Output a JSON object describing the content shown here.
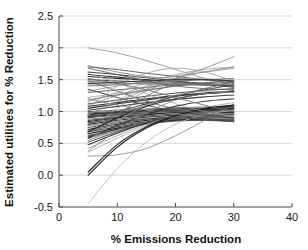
{
  "chart_data": {
    "type": "line",
    "title": "",
    "xlabel": "% Emissions Reduction",
    "ylabel": "Estimated utilities for % Reduction",
    "xlim": [
      0,
      40
    ],
    "ylim": [
      -0.5,
      2.5
    ],
    "xticks": [
      0,
      10,
      20,
      30,
      40
    ],
    "xtick_labels": [
      "0",
      "10",
      "20",
      "30",
      "40"
    ],
    "yticks": [
      -0.5,
      0.0,
      0.5,
      1.0,
      1.5,
      2.0,
      2.5
    ],
    "ytick_labels": [
      "-0.5",
      "0.0",
      "0.5",
      "1.0",
      "1.5",
      "2.0",
      "2.5"
    ],
    "grid": "horizontal",
    "grid_color": "#c8c8c8",
    "legend": "none",
    "x_data_range": [
      5,
      30
    ],
    "x": [
      5,
      10,
      15,
      20,
      25,
      30
    ],
    "series": [
      {
        "name": "r01",
        "values": [
          2.0,
          1.92,
          1.8,
          1.66,
          1.52,
          1.4
        ],
        "color": "#8c8c8c",
        "width": 0.8
      },
      {
        "name": "r02",
        "values": [
          1.72,
          1.62,
          1.55,
          1.52,
          1.5,
          1.48
        ],
        "color": "#777777",
        "width": 0.8
      },
      {
        "name": "r03",
        "values": [
          1.7,
          1.66,
          1.6,
          1.55,
          1.5,
          1.46
        ],
        "color": "#555555",
        "width": 0.9
      },
      {
        "name": "r04",
        "values": [
          1.62,
          1.58,
          1.53,
          1.48,
          1.43,
          1.38
        ],
        "color": "#444444",
        "width": 1.0
      },
      {
        "name": "r05",
        "values": [
          1.58,
          1.54,
          1.5,
          1.47,
          1.44,
          1.4
        ],
        "color": "#3a3a3a",
        "width": 1.1
      },
      {
        "name": "r06",
        "values": [
          1.55,
          1.52,
          1.49,
          1.46,
          1.43,
          1.4
        ],
        "color": "#303030",
        "width": 1.1
      },
      {
        "name": "r07",
        "values": [
          1.5,
          1.48,
          1.46,
          1.44,
          1.42,
          1.4
        ],
        "color": "#4a4a4a",
        "width": 1.0
      },
      {
        "name": "r08",
        "values": [
          1.48,
          1.45,
          1.43,
          1.42,
          1.41,
          1.4
        ],
        "color": "#666666",
        "width": 0.8
      },
      {
        "name": "r09",
        "values": [
          1.45,
          1.44,
          1.44,
          1.44,
          1.43,
          1.42
        ],
        "color": "#8a8a8a",
        "width": 0.8
      },
      {
        "name": "r10",
        "values": [
          1.42,
          1.43,
          1.44,
          1.45,
          1.44,
          1.42
        ],
        "color": "#9a9a9a",
        "width": 0.8
      },
      {
        "name": "r11",
        "values": [
          1.4,
          1.42,
          1.45,
          1.48,
          1.5,
          1.52
        ],
        "color": "#707070",
        "width": 0.9
      },
      {
        "name": "r12",
        "values": [
          1.32,
          1.4,
          1.48,
          1.56,
          1.62,
          1.68
        ],
        "color": "#8f8f8f",
        "width": 0.8
      },
      {
        "name": "r13",
        "values": [
          1.3,
          1.34,
          1.38,
          1.42,
          1.44,
          1.46
        ],
        "color": "#5a5a5a",
        "width": 0.9
      },
      {
        "name": "r14",
        "values": [
          1.22,
          1.28,
          1.34,
          1.4,
          1.45,
          1.5
        ],
        "color": "#a0a0a0",
        "width": 0.8
      },
      {
        "name": "r15",
        "values": [
          1.18,
          1.26,
          1.33,
          1.4,
          1.45,
          1.48
        ],
        "color": "#606060",
        "width": 0.9
      },
      {
        "name": "r16",
        "values": [
          1.15,
          1.3,
          1.45,
          1.58,
          1.66,
          1.7
        ],
        "color": "#9c9c9c",
        "width": 0.8
      },
      {
        "name": "r17",
        "values": [
          1.12,
          1.18,
          1.24,
          1.29,
          1.33,
          1.36
        ],
        "color": "#4f4f4f",
        "width": 1.0
      },
      {
        "name": "r18",
        "values": [
          1.08,
          1.14,
          1.2,
          1.25,
          1.29,
          1.32
        ],
        "color": "#3c3c3c",
        "width": 1.1
      },
      {
        "name": "r19",
        "values": [
          1.05,
          1.12,
          1.18,
          1.24,
          1.28,
          1.31
        ],
        "color": "#2e2e2e",
        "width": 1.2
      },
      {
        "name": "r20",
        "values": [
          1.02,
          1.08,
          1.14,
          1.19,
          1.23,
          1.26
        ],
        "color": "#424242",
        "width": 1.1
      },
      {
        "name": "r21",
        "values": [
          1.0,
          1.02,
          1.04,
          1.06,
          1.07,
          1.08
        ],
        "color": "#6b6b6b",
        "width": 0.9
      },
      {
        "name": "r22",
        "values": [
          0.98,
          1.0,
          1.02,
          1.04,
          1.05,
          1.06
        ],
        "color": "#555555",
        "width": 1.0
      },
      {
        "name": "r23",
        "values": [
          0.96,
          0.99,
          1.02,
          1.04,
          1.05,
          1.05
        ],
        "color": "#3a3a3a",
        "width": 1.1
      },
      {
        "name": "r24",
        "values": [
          0.95,
          0.98,
          1.0,
          1.02,
          1.03,
          1.04
        ],
        "color": "#2a2a2a",
        "width": 1.2
      },
      {
        "name": "r25",
        "values": [
          0.93,
          0.97,
          1.0,
          1.02,
          1.03,
          1.03
        ],
        "color": "#484848",
        "width": 1.0
      },
      {
        "name": "r26",
        "values": [
          0.92,
          0.95,
          0.98,
          1.0,
          1.01,
          1.02
        ],
        "color": "#333333",
        "width": 1.1
      },
      {
        "name": "r27",
        "values": [
          0.9,
          0.94,
          0.97,
          0.99,
          1.0,
          1.0
        ],
        "color": "#5e5e5e",
        "width": 0.9
      },
      {
        "name": "r28",
        "values": [
          0.88,
          0.92,
          0.96,
          0.99,
          1.0,
          1.0
        ],
        "color": "#7a7a7a",
        "width": 0.8
      },
      {
        "name": "r29",
        "values": [
          0.86,
          0.91,
          0.95,
          0.98,
          0.99,
          0.99
        ],
        "color": "#414141",
        "width": 1.1
      },
      {
        "name": "r30",
        "values": [
          0.84,
          0.9,
          0.95,
          0.98,
          0.99,
          0.98
        ],
        "color": "#2d2d2d",
        "width": 1.2
      },
      {
        "name": "r31",
        "values": [
          0.82,
          0.88,
          0.93,
          0.96,
          0.97,
          0.96
        ],
        "color": "#505050",
        "width": 1.0
      },
      {
        "name": "r32",
        "values": [
          0.8,
          0.86,
          0.91,
          0.94,
          0.95,
          0.95
        ],
        "color": "#383838",
        "width": 1.1
      },
      {
        "name": "r33",
        "values": [
          0.78,
          0.84,
          0.89,
          0.92,
          0.93,
          0.92
        ],
        "color": "#646464",
        "width": 0.9
      },
      {
        "name": "r34",
        "values": [
          0.75,
          0.82,
          0.88,
          0.91,
          0.92,
          0.9
        ],
        "color": "#444444",
        "width": 1.0
      },
      {
        "name": "r35",
        "values": [
          0.72,
          0.8,
          0.86,
          0.9,
          0.91,
          0.89
        ],
        "color": "#2c2c2c",
        "width": 1.2
      },
      {
        "name": "r36",
        "values": [
          0.7,
          0.78,
          0.84,
          0.88,
          0.89,
          0.87
        ],
        "color": "#585858",
        "width": 1.0
      },
      {
        "name": "r37",
        "values": [
          0.68,
          0.76,
          0.83,
          0.87,
          0.88,
          0.86
        ],
        "color": "#3e3e3e",
        "width": 1.1
      },
      {
        "name": "r38",
        "values": [
          0.65,
          0.74,
          0.81,
          0.86,
          0.87,
          0.85
        ],
        "color": "#262626",
        "width": 1.2
      },
      {
        "name": "r39",
        "values": [
          0.62,
          0.72,
          0.8,
          0.85,
          0.86,
          0.84
        ],
        "color": "#4c4c4c",
        "width": 1.0
      },
      {
        "name": "r40",
        "values": [
          0.6,
          0.72,
          0.82,
          0.89,
          0.93,
          0.95
        ],
        "color": "#353535",
        "width": 1.1
      },
      {
        "name": "r41",
        "values": [
          0.58,
          0.7,
          0.81,
          0.89,
          0.94,
          0.96
        ],
        "color": "#6e6e6e",
        "width": 0.9
      },
      {
        "name": "r42",
        "values": [
          0.55,
          0.7,
          0.83,
          0.93,
          0.99,
          1.02
        ],
        "color": "#8b8b8b",
        "width": 0.8
      },
      {
        "name": "r43",
        "values": [
          0.52,
          0.68,
          0.82,
          0.93,
          1.0,
          1.04
        ],
        "color": "#474747",
        "width": 1.0
      },
      {
        "name": "r44",
        "values": [
          0.48,
          0.66,
          0.82,
          0.94,
          1.02,
          1.06
        ],
        "color": "#323232",
        "width": 1.1
      },
      {
        "name": "r45",
        "values": [
          0.42,
          0.62,
          0.8,
          0.94,
          1.04,
          1.1
        ],
        "color": "#979797",
        "width": 0.8
      },
      {
        "name": "r46",
        "values": [
          0.36,
          0.58,
          0.78,
          0.94,
          1.06,
          1.14
        ],
        "color": "#a5a5a5",
        "width": 0.8
      },
      {
        "name": "r47",
        "values": [
          0.3,
          0.32,
          0.42,
          0.62,
          0.86,
          1.12
        ],
        "color": "#888888",
        "width": 0.8
      },
      {
        "name": "r48",
        "values": [
          0.05,
          0.48,
          0.76,
          0.94,
          1.05,
          1.1
        ],
        "color": "#2a2a2a",
        "width": 1.2
      },
      {
        "name": "r49",
        "values": [
          0.0,
          0.44,
          0.74,
          0.93,
          1.04,
          1.09
        ],
        "color": "#1f1f1f",
        "width": 1.2
      },
      {
        "name": "r50",
        "values": [
          -0.45,
          0.1,
          0.52,
          0.8,
          0.95,
          1.02
        ],
        "color": "#b4b4b4",
        "width": 0.8
      },
      {
        "name": "r51",
        "values": [
          1.6,
          1.45,
          1.28,
          1.12,
          1.0,
          0.92
        ],
        "color": "#9e9e9e",
        "width": 0.8
      },
      {
        "name": "r52",
        "values": [
          1.48,
          1.32,
          1.16,
          1.04,
          0.96,
          0.9
        ],
        "color": "#6a6a6a",
        "width": 0.9
      },
      {
        "name": "r53",
        "values": [
          1.35,
          1.22,
          1.1,
          1.0,
          0.94,
          0.9
        ],
        "color": "#4d4d4d",
        "width": 1.0
      },
      {
        "name": "r54",
        "values": [
          1.2,
          1.1,
          1.02,
          0.96,
          0.92,
          0.88
        ],
        "color": "#828282",
        "width": 0.8
      },
      {
        "name": "r55",
        "values": [
          1.0,
          0.96,
          0.93,
          0.9,
          0.88,
          0.86
        ],
        "color": "#595959",
        "width": 0.9
      },
      {
        "name": "r56",
        "values": [
          0.95,
          1.18,
          1.38,
          1.5,
          1.52,
          1.44
        ],
        "color": "#a8a8a8",
        "width": 0.8
      },
      {
        "name": "r57",
        "values": [
          0.7,
          1.05,
          1.32,
          1.48,
          1.5,
          1.4
        ],
        "color": "#909090",
        "width": 0.8
      },
      {
        "name": "r58",
        "values": [
          0.62,
          0.95,
          1.24,
          1.44,
          1.5,
          1.44
        ],
        "color": "#757575",
        "width": 0.9
      },
      {
        "name": "r59",
        "values": [
          0.58,
          0.78,
          0.95,
          1.08,
          1.16,
          1.2
        ],
        "color": "#3b3b3b",
        "width": 1.1
      },
      {
        "name": "r60",
        "values": [
          0.68,
          0.9,
          1.08,
          1.2,
          1.28,
          1.32
        ],
        "color": "#2f2f2f",
        "width": 1.2
      },
      {
        "name": "r61",
        "values": [
          1.52,
          1.44,
          1.34,
          1.22,
          1.1,
          1.0
        ],
        "color": "#737373",
        "width": 0.9
      },
      {
        "name": "r62",
        "values": [
          1.05,
          1.4,
          1.6,
          1.68,
          1.62,
          1.48
        ],
        "color": "#9b9b9b",
        "width": 0.8
      },
      {
        "name": "r63",
        "values": [
          0.9,
          1.0,
          1.12,
          1.24,
          1.34,
          1.42
        ],
        "color": "#464646",
        "width": 1.0
      },
      {
        "name": "r64",
        "values": [
          0.8,
          0.95,
          1.1,
          1.24,
          1.36,
          1.46
        ],
        "color": "#5c5c5c",
        "width": 0.9
      },
      {
        "name": "r65",
        "values": [
          1.1,
          1.25,
          1.4,
          1.52,
          1.62,
          1.7
        ],
        "color": "#8e8e8e",
        "width": 0.8
      },
      {
        "name": "r66",
        "values": [
          0.95,
          1.15,
          1.35,
          1.52,
          1.68,
          1.86
        ],
        "color": "#7f7f7f",
        "width": 0.8
      },
      {
        "name": "r67",
        "values": [
          1.68,
          1.58,
          1.48,
          1.4,
          1.36,
          1.34
        ],
        "color": "#626262",
        "width": 0.9
      },
      {
        "name": "r68",
        "values": [
          1.44,
          1.46,
          1.48,
          1.5,
          1.5,
          1.48
        ],
        "color": "#3d3d3d",
        "width": 1.1
      },
      {
        "name": "r69",
        "values": [
          0.55,
          0.85,
          1.1,
          1.26,
          1.32,
          1.3
        ],
        "color": "#a2a2a2",
        "width": 0.8
      },
      {
        "name": "r70",
        "values": [
          0.38,
          0.7,
          0.98,
          1.18,
          1.28,
          1.3
        ],
        "color": "#868686",
        "width": 0.8
      }
    ]
  },
  "axes": {
    "tick_font_size": 11,
    "label_font_size": 11.5
  }
}
